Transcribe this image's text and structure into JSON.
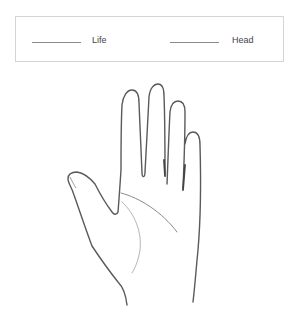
{
  "legend": {
    "items": [
      {
        "label": "Life",
        "color": "#8a8a8a"
      },
      {
        "label": "Head",
        "color": "#8a8a8a"
      }
    ]
  },
  "diagram": {
    "outline_color": "#555555",
    "lines": [
      {
        "name": "life-line",
        "color": "#b5b5b5"
      },
      {
        "name": "head-line",
        "color": "#8a8a8a"
      }
    ]
  }
}
